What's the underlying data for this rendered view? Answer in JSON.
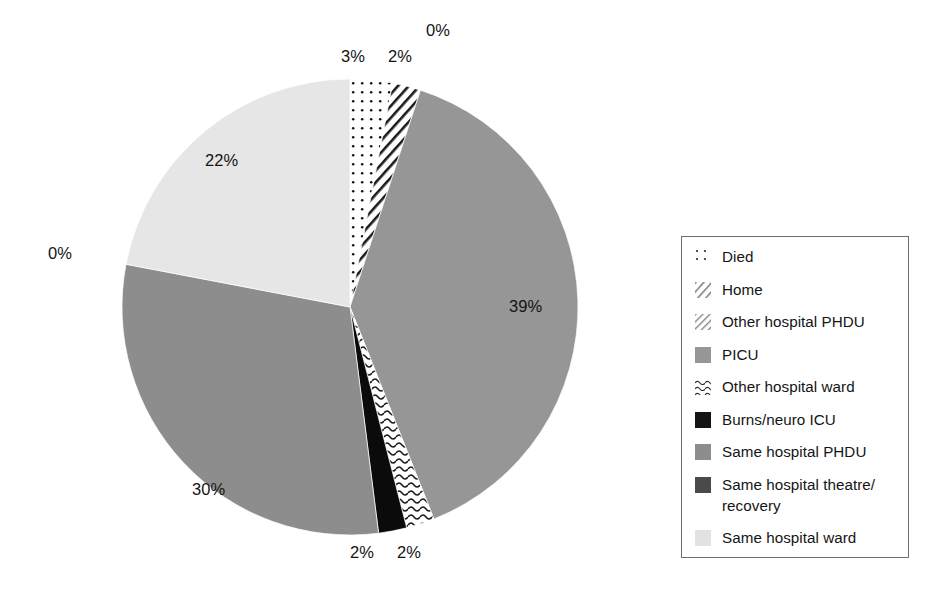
{
  "chart_data": {
    "type": "pie",
    "title": "",
    "subtitle": "",
    "xlabel": "",
    "ylabel": "",
    "grid": false,
    "legend_position": "right",
    "start_angle_deg": 0,
    "direction": "clockwise",
    "value_unit": "percent",
    "categories": [
      "Died",
      "Home",
      "Other hospital PHDU",
      "PICU",
      "Other hospital ward",
      "Burns/neuro ICU",
      "Same hospital PHDU",
      "Same hospital theatre/recovery",
      "Same hospital ward"
    ],
    "values": [
      3,
      2,
      0,
      39,
      2,
      2,
      30,
      0,
      22
    ],
    "data_labels": [
      "3%",
      "2%",
      "0%",
      "39%",
      "2%",
      "2%",
      "30%",
      "0%",
      "22%"
    ],
    "slices": [
      {
        "label": "Died",
        "value": 3,
        "data_label": "3%",
        "fill_style": "dotted",
        "fill_color": "#ffffff",
        "pattern_color": "#111111",
        "label_x": 341,
        "label_y": 57
      },
      {
        "label": "Home",
        "value": 2,
        "data_label": "2%",
        "fill_style": "diagonal-hatch",
        "fill_color": "#ffffff",
        "pattern_color": "#1a1a1a",
        "label_x": 388,
        "label_y": 57
      },
      {
        "label": "Other hospital PHDU",
        "value": 0,
        "data_label": "0%",
        "fill_style": "light-diagonal",
        "fill_color": "#ffffff",
        "pattern_color": "#555555",
        "label_x": 426,
        "label_y": 31
      },
      {
        "label": "PICU",
        "value": 39,
        "data_label": "39%",
        "fill_style": "solid",
        "fill_color": "#969696",
        "pattern_color": "",
        "label_x": 509,
        "label_y": 307
      },
      {
        "label": "Other hospital ward",
        "value": 2,
        "data_label": "2%",
        "fill_style": "wavy",
        "fill_color": "#ffffff",
        "pattern_color": "#1a1a1a",
        "label_x": 397,
        "label_y": 553
      },
      {
        "label": "Burns/neuro ICU",
        "value": 2,
        "data_label": "2%",
        "fill_style": "solid",
        "fill_color": "#0b0b0b",
        "pattern_color": "",
        "label_x": 350,
        "label_y": 553
      },
      {
        "label": "Same hospital PHDU",
        "value": 30,
        "data_label": "30%",
        "fill_style": "solid",
        "fill_color": "#8d8d8d",
        "pattern_color": "",
        "label_x": 192,
        "label_y": 490
      },
      {
        "label": "Same hospital theatre/recovery",
        "value": 0,
        "data_label": "0%",
        "fill_style": "solid",
        "fill_color": "#6b6b6b",
        "pattern_color": "",
        "label_x": 48,
        "label_y": 254
      },
      {
        "label": "Same hospital ward",
        "value": 22,
        "data_label": "22%",
        "fill_style": "solid",
        "fill_color": "#e6e6e6",
        "pattern_color": "",
        "label_x": 205,
        "label_y": 161
      }
    ],
    "geometry": {
      "center_x": 350,
      "center_y": 307,
      "radius": 228
    }
  },
  "legend": {
    "border_color": "#6e6e6e",
    "items": [
      {
        "label": "Died",
        "swatch": "dotted-swatch"
      },
      {
        "label": "Home",
        "swatch": "diagonal-hatch-swatch"
      },
      {
        "label": "Other hospital PHDU",
        "swatch": "light-diagonal-swatch"
      },
      {
        "label": "PICU",
        "swatch": "solid-mid-gray-swatch"
      },
      {
        "label": "Other hospital ward",
        "swatch": "wavy-swatch"
      },
      {
        "label": "Burns/neuro ICU",
        "swatch": "solid-black-swatch"
      },
      {
        "label": "Same hospital PHDU",
        "swatch": "solid-gray-swatch"
      },
      {
        "label": "Same hospital theatre/\nrecovery",
        "swatch": "solid-dark-gray-swatch"
      },
      {
        "label": "Same hospital ward",
        "swatch": "solid-light-gray-swatch"
      }
    ]
  },
  "background_bleed": {
    "lines": [
      {
        "text": "stability",
        "x": 205,
        "y": 178,
        "size": 41
      },
      {
        "text": "not well",
        "x": 238,
        "y": 240,
        "size": 41
      },
      {
        "text": "stablished",
        "x": 206,
        "y": 300,
        "size": 41
      }
    ]
  },
  "colors": {
    "picu": "#969696",
    "same_hospital_phdu": "#8d8d8d",
    "same_hospital_ward": "#e6e6e6",
    "same_hospital_theatre": "#6b6b6b",
    "burns_neuro_icu": "#0b0b0b",
    "legend_border": "#6e6e6e",
    "text": "#151515"
  }
}
